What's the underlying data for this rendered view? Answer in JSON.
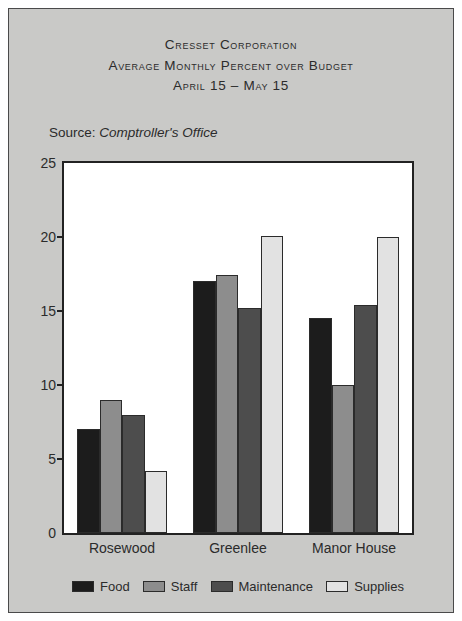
{
  "figure": {
    "title_lines": [
      "Cresset Corporation",
      "Average Monthly Percent over Budget",
      "April 15 – May 15"
    ],
    "source_label": "Source:",
    "source_value": "Comptroller's Office"
  },
  "chart_data": {
    "type": "bar",
    "xlabel": "",
    "ylabel": "",
    "ylim": [
      0,
      25
    ],
    "yticks": [
      0,
      5,
      10,
      15,
      20,
      25
    ],
    "grid": false,
    "legend_position": "bottom",
    "categories": [
      "Rosewood",
      "Greenlee",
      "Manor House"
    ],
    "series": [
      {
        "name": "Food",
        "color": "#1c1c1c",
        "values": [
          7.0,
          17.0,
          14.5
        ]
      },
      {
        "name": "Staff",
        "color": "#8d8d8d",
        "values": [
          9.0,
          17.4,
          10.0
        ]
      },
      {
        "name": "Maintenance",
        "color": "#4d4d4d",
        "values": [
          8.0,
          15.2,
          15.4
        ]
      },
      {
        "name": "Supplies",
        "color": "#e2e2e2",
        "values": [
          4.2,
          20.1,
          20.0
        ]
      }
    ]
  }
}
